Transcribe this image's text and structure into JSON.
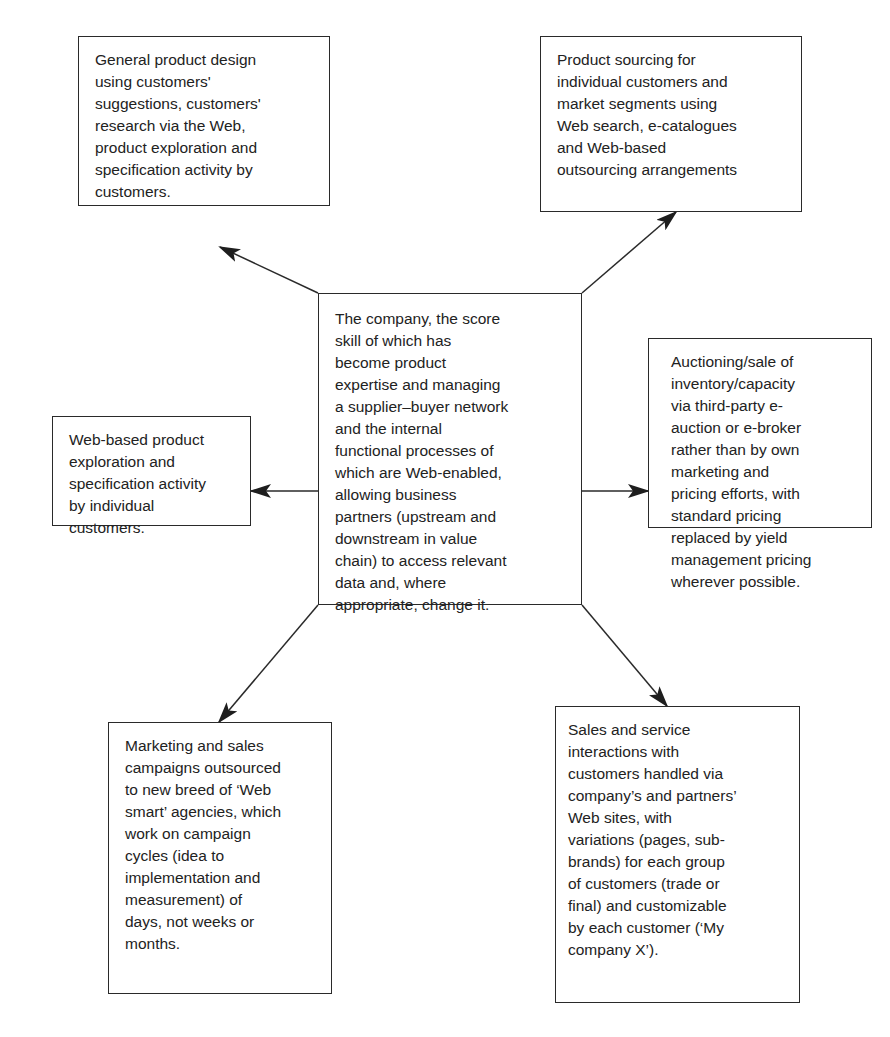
{
  "diagram": {
    "type": "hub-and-spoke",
    "colors": {
      "stroke": "#2a2a2a",
      "text": "#222222",
      "background": "#ffffff"
    },
    "center": {
      "id": "center",
      "text": "The company, the score\nskill of which has\nbecome product\nexpertise and managing\na supplier–buyer network\nand the internal\nfunctional processes of\nwhich are Web-enabled,\nallowing business\npartners (upstream and\ndownstream in value\nchain) to access relevant\ndata and, where\nappropriate, change it."
    },
    "nodes": [
      {
        "id": "top-left",
        "text": "General product design\nusing customers'\nsuggestions, customers'\nresearch via the Web,\nproduct exploration and\nspecification activity by\ncustomers."
      },
      {
        "id": "top-right",
        "text": "Product sourcing for\nindividual customers and\nmarket segments using\nWeb search, e-catalogues\nand Web-based\noutsourcing arrangements"
      },
      {
        "id": "left",
        "text": "Web-based product\nexploration and\nspecification activity\nby individual\ncustomers."
      },
      {
        "id": "right",
        "text": "Auctioning/sale of\ninventory/capacity\nvia third-party e-\nauction or e-broker\nrather than by own\nmarketing and\npricing efforts, with\nstandard pricing\nreplaced by yield\nmanagement pricing\nwherever possible."
      },
      {
        "id": "bottom-left",
        "text": "Marketing and sales\ncampaigns outsourced\nto new breed of ‘Web\nsmart’ agencies, which\nwork on campaign\ncycles (idea to\nimplementation and\nmeasurement) of\ndays, not weeks or\nmonths."
      },
      {
        "id": "bottom-right",
        "text": "Sales and service\ninteractions with\ncustomers handled via\ncompany’s and partners’\nWeb sites, with\nvariations (pages, sub-\nbrands) for each group\nof customers (trade or\nfinal) and customizable\nby each customer (‘My\ncompany X’)."
      }
    ],
    "edges": [
      {
        "from": "center",
        "to": "top-left"
      },
      {
        "from": "center",
        "to": "top-right"
      },
      {
        "from": "center",
        "to": "left"
      },
      {
        "from": "center",
        "to": "right"
      },
      {
        "from": "center",
        "to": "bottom-left"
      },
      {
        "from": "center",
        "to": "bottom-right"
      }
    ]
  }
}
